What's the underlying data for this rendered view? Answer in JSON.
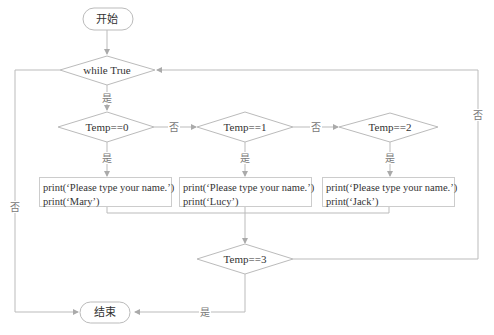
{
  "diagram": {
    "type": "flowchart",
    "start": "开始",
    "end": "结束",
    "loop_condition": "while True",
    "decisions": [
      "Temp==0",
      "Temp==1",
      "Temp==2",
      "Temp==3"
    ],
    "yes_label": "是",
    "no_label": "否",
    "process_boxes": [
      {
        "line1": "print(‘Please type your name.’)",
        "line2": "print(‘Mary’)"
      },
      {
        "line1": "print(‘Please type your name.’)",
        "line2": "print(‘Lucy’)"
      },
      {
        "line1": "print(‘Please type your name.’)",
        "line2": "print(‘Jack’)"
      }
    ],
    "colors": {
      "line": "#bbbbbb",
      "text": "#333333",
      "label": "#777777"
    }
  }
}
